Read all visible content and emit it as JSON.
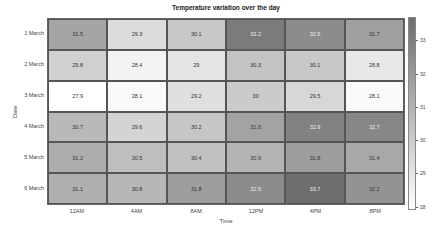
{
  "chart_data": {
    "type": "heatmap",
    "title": "Temperature variation over the day",
    "xlabel": "Time",
    "ylabel": "Date",
    "x": [
      "12AM",
      "4AM",
      "8AM",
      "12PM",
      "4PM",
      "8PM"
    ],
    "y": [
      "1 March",
      "2 March",
      "3 March",
      "4 March",
      "5 March",
      "6 March"
    ],
    "values": [
      [
        31.5,
        29.3,
        30.1,
        33.2,
        32.5,
        31.7
      ],
      [
        29.8,
        28.4,
        29,
        30.3,
        30.1,
        28.8
      ],
      [
        27.9,
        28.1,
        29.2,
        30,
        29.5,
        28.1
      ],
      [
        30.7,
        29.6,
        30.2,
        31.6,
        32.9,
        32.7
      ],
      [
        31.2,
        30.5,
        30.4,
        30.9,
        31.8,
        31.4
      ],
      [
        31.1,
        30.8,
        31.8,
        32.5,
        33.7,
        32.2
      ]
    ],
    "colorbar": {
      "ticks": [
        33,
        32,
        31,
        30,
        29,
        28
      ],
      "range": [
        27.9,
        33.7
      ],
      "colormap": "grays (dark = high)"
    },
    "grid": true
  },
  "labels": {
    "title": "Temperature variation over the day",
    "xlabel": "Time",
    "ylabel": "Date"
  },
  "colors": {
    "high": "#6e6e6e",
    "low": "#ffffff",
    "grid_line": "#555555"
  }
}
